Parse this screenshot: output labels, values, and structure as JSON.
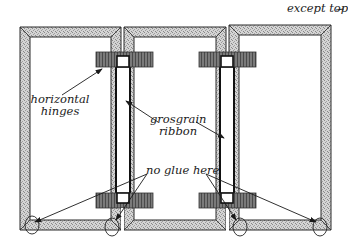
{
  "diagram": {
    "labels": {
      "except_top": "except top",
      "horizontal_hinges_line1": "horizontal",
      "horizontal_hinges_line2": "hinges",
      "grosgrain_ribbon_line1": "grosgrain",
      "grosgrain_ribbon_line2": "ribbon",
      "no_glue_here": "no glue here"
    },
    "panels": [
      {
        "id": "left-panel",
        "x": 20,
        "y": 27,
        "w": 101,
        "h": 203
      },
      {
        "id": "middle-panel",
        "x": 124,
        "y": 27,
        "w": 102,
        "h": 203
      },
      {
        "id": "right-panel",
        "x": 229,
        "y": 25,
        "w": 102,
        "h": 205
      }
    ],
    "ribbons": [
      {
        "id": "ribbon-left",
        "x": 116,
        "y": 55,
        "w": 14,
        "h": 142
      },
      {
        "id": "ribbon-right",
        "x": 220,
        "y": 55,
        "w": 14,
        "h": 142
      }
    ],
    "hinges": [
      {
        "id": "hinge-top-left",
        "x": 96,
        "y": 52,
        "w": 57,
        "h": 15
      },
      {
        "id": "hinge-top-right",
        "x": 199,
        "y": 52,
        "w": 57,
        "h": 15
      },
      {
        "id": "hinge-bottom-left",
        "x": 96,
        "y": 193,
        "w": 57,
        "h": 15
      },
      {
        "id": "hinge-bottom-right",
        "x": 199,
        "y": 193,
        "w": 57,
        "h": 15
      }
    ],
    "colors": {
      "frame_fill": "#c9c9c9",
      "hinge_fill": "#6e6e6e",
      "outline": "#2a2a2a",
      "ribbon_fill": "#ffffff",
      "text": "#1a1a1a"
    }
  }
}
